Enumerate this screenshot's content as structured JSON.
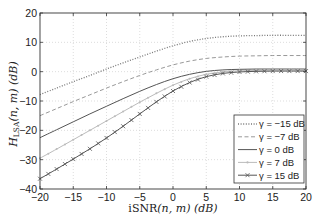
{
  "chart_data": {
    "type": "line",
    "title": "",
    "xlabel": "iSNR(n, m) (dB)",
    "ylabel": "H_LSA(n, m) (dB)",
    "xlim": [
      -20,
      20
    ],
    "ylim": [
      -40,
      20
    ],
    "xticks": [
      -20,
      -15,
      -10,
      -5,
      0,
      5,
      10,
      15,
      20
    ],
    "yticks": [
      -40,
      -30,
      -20,
      -10,
      0,
      10,
      20
    ],
    "grid": true,
    "legend_position": "lower right",
    "x": [
      -20,
      -17.5,
      -15,
      -12.5,
      -10,
      -7.5,
      -5,
      -2.5,
      0,
      2.5,
      5,
      7.5,
      10,
      12.5,
      15,
      17.5,
      20
    ],
    "series": [
      {
        "name": "γ = −15 dB",
        "style": "dotted",
        "color": "#777777",
        "marker": "none",
        "values": [
          -7.8,
          -5.6,
          -3.4,
          -1.3,
          0.9,
          3.0,
          5.0,
          7.0,
          8.8,
          10.3,
          11.3,
          11.9,
          12.2,
          12.3,
          12.4,
          12.4,
          12.4
        ]
      },
      {
        "name": "γ = −7 dB",
        "style": "dashed",
        "color": "#999999",
        "marker": "none",
        "values": [
          -15.0,
          -12.6,
          -10.2,
          -7.9,
          -5.6,
          -3.4,
          -1.3,
          0.6,
          2.3,
          3.6,
          4.5,
          5.0,
          5.3,
          5.4,
          5.5,
          5.5,
          5.5
        ]
      },
      {
        "name": "γ = 0 dB",
        "style": "solid",
        "color": "#555555",
        "marker": "none",
        "values": [
          -22.5,
          -19.8,
          -17.1,
          -14.4,
          -11.8,
          -9.2,
          -6.7,
          -4.4,
          -2.4,
          -0.9,
          0.1,
          0.6,
          0.8,
          0.9,
          0.9,
          0.9,
          0.9
        ]
      },
      {
        "name": "γ = 7 dB",
        "style": "solid",
        "color": "#bbbbbb",
        "marker": "dot",
        "values": [
          -29.5,
          -26.4,
          -23.2,
          -20.0,
          -16.8,
          -13.6,
          -10.4,
          -7.4,
          -4.6,
          -2.4,
          -0.9,
          -0.1,
          0.3,
          0.4,
          0.5,
          0.5,
          0.5
        ]
      },
      {
        "name": "γ = 15 dB",
        "style": "solid",
        "color": "#555555",
        "marker": "x",
        "values": [
          -36.5,
          -33.2,
          -29.8,
          -26.3,
          -22.6,
          -18.6,
          -14.4,
          -10.3,
          -6.6,
          -3.7,
          -1.7,
          -0.6,
          -0.1,
          0.1,
          0.2,
          0.2,
          0.2
        ]
      }
    ]
  },
  "labels": {
    "xlabel_main": "iSNR",
    "xlabel_args": "(n, m) (dB)",
    "ylabel_main": "H",
    "ylabel_sub": "LSA",
    "ylabel_args": "(n, m) (dB)"
  }
}
